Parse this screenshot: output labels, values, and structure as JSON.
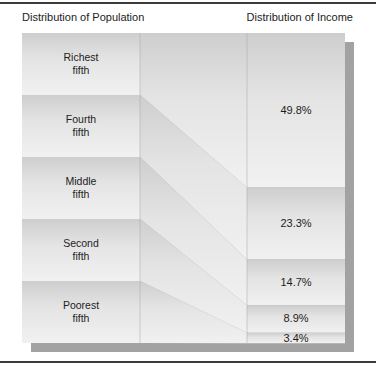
{
  "header": {
    "left_title": "Distribution of Population",
    "right_title": "Distribution of Income"
  },
  "bands": [
    {
      "label_line1": "Richest",
      "label_line2": "fifth",
      "income_pct": "49.8%"
    },
    {
      "label_line1": "Fourth",
      "label_line2": "fifth",
      "income_pct": "23.3%"
    },
    {
      "label_line1": "Middle",
      "label_line2": "fifth",
      "income_pct": "14.7%"
    },
    {
      "label_line1": "Second",
      "label_line2": "fifth",
      "income_pct": "8.9%"
    },
    {
      "label_line1": "Poorest",
      "label_line2": "fifth",
      "income_pct": "3.4%"
    }
  ],
  "colors": {
    "band_gradient_top": "#cecece",
    "band_gradient_mid": "#e4e4e4",
    "band_gradient_bottom": "#f1f1f1",
    "shadow": "#a2a2a2",
    "rule": "#3c3c3c",
    "text": "#1d1d1d"
  },
  "chart_data": {
    "type": "area",
    "title": "",
    "categories": [
      "Richest fifth",
      "Fourth fifth",
      "Middle fifth",
      "Second fifth",
      "Poorest fifth"
    ],
    "series": [
      {
        "name": "Distribution of Population",
        "values": [
          20,
          20,
          20,
          20,
          20
        ]
      },
      {
        "name": "Distribution of Income",
        "values": [
          49.8,
          23.3,
          14.7,
          8.9,
          3.4
        ]
      }
    ],
    "value_unit": "%",
    "legend_position": "top",
    "grid": false
  }
}
